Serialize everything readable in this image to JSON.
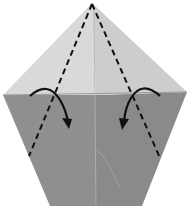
{
  "diagram": {
    "type": "origami-fold-step",
    "colors": {
      "background": "#ffffff",
      "upper_paper": "#d8d8d8",
      "upper_paper_right": "#cfcfcf",
      "lower_paper": "#8e8e8e",
      "lower_paper_right": "#8a8a8a",
      "fold_line": "#111111",
      "arrow": "#111111",
      "crease": "#a0a0a0"
    },
    "elements": [
      {
        "name": "upper-triangle",
        "kind": "paper-layer",
        "label": "Upper layer (light)"
      },
      {
        "name": "lower-body",
        "kind": "paper-layer",
        "label": "Lower layer (dark)"
      },
      {
        "name": "center-crease",
        "kind": "crease",
        "label": "Center crease"
      },
      {
        "name": "left-valley-fold-line",
        "kind": "dashed-line",
        "label": "Left valley fold"
      },
      {
        "name": "right-valley-fold-line",
        "kind": "dashed-line",
        "label": "Right valley fold"
      },
      {
        "name": "left-fold-arrow",
        "kind": "arrow",
        "label": "Fold left flap inward"
      },
      {
        "name": "right-fold-arrow",
        "kind": "arrow",
        "label": "Fold right flap inward"
      }
    ]
  }
}
